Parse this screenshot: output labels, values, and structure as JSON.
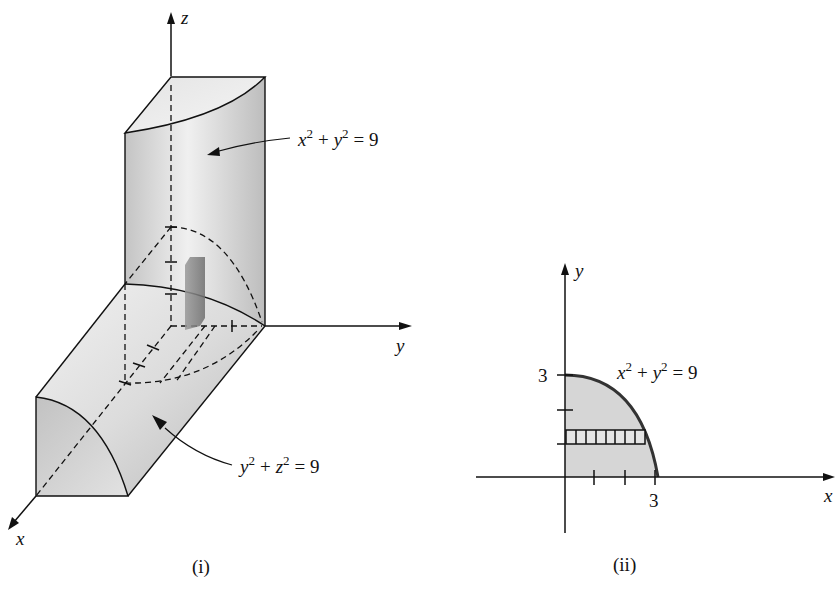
{
  "figure_i": {
    "caption": "(i)",
    "axes": {
      "x": "x",
      "y": "y",
      "z": "z"
    },
    "labels": {
      "cylinder_vertical": {
        "lhs_a": "x",
        "sup_a": "2",
        "plus": "+",
        "lhs_b": "y",
        "sup_b": "2",
        "rhs": "= 9"
      },
      "cylinder_horizontal": {
        "lhs_a": "y",
        "sup_a": "2",
        "plus": "+",
        "lhs_b": "z",
        "sup_b": "2",
        "rhs": "= 9"
      }
    }
  },
  "figure_ii": {
    "caption": "(ii)",
    "axes": {
      "x": "x",
      "y": "y"
    },
    "tick_labels": {
      "x_max": "3",
      "y_max": "3"
    },
    "curve_label": {
      "lhs_a": "x",
      "sup_a": "2",
      "plus": "+",
      "lhs_b": "y",
      "sup_b": "2",
      "rhs": "= 9"
    },
    "strip_cells": 8
  },
  "colors": {
    "ink": "#111111",
    "shade_light": "#ededed",
    "shade_mid": "#c8c8c8",
    "shade_dark": "#8a8a8a",
    "region_fill": "#d6d6d6"
  }
}
